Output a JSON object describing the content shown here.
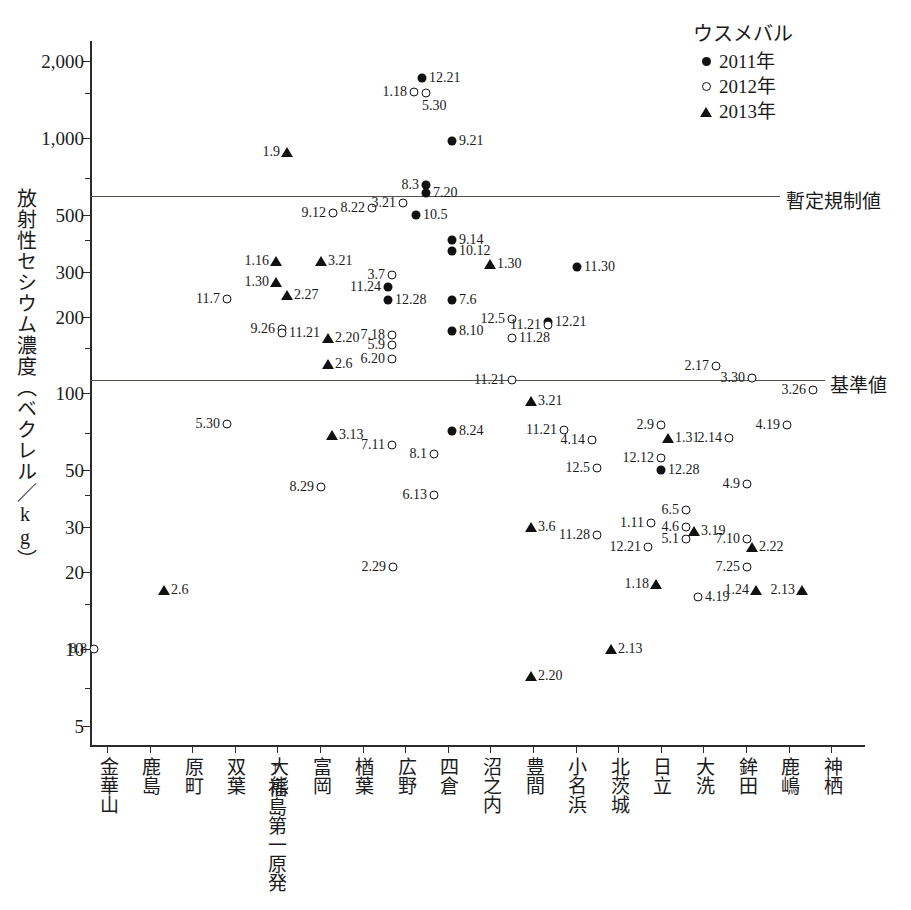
{
  "chart_data": {
    "type": "scatter",
    "title": "",
    "xlabel": "",
    "ylabel": "放射性セシウム濃度（ベクレル／kg）",
    "yscale": "log",
    "ylim": [
      4.2,
      2400
    ],
    "ytick_labels": [
      "2,000",
      "1,000",
      "500",
      "300",
      "200",
      "100",
      "50",
      "30",
      "20",
      "10",
      "5"
    ],
    "ytick_values": [
      2000,
      1000,
      500,
      300,
      200,
      100,
      50,
      30,
      20,
      10,
      5
    ],
    "grid": false,
    "legend_position": "top-right",
    "legend_title": "ウスメバル",
    "series": [
      {
        "name": "2011年",
        "marker": "filled-circle"
      },
      {
        "name": "2012年",
        "marker": "open-circle"
      },
      {
        "name": "2013年",
        "marker": "triangle"
      }
    ],
    "reference_lines": [
      {
        "value": 500,
        "label": "暫定規制値"
      },
      {
        "value": 100,
        "label": "基準値"
      }
    ],
    "categories": [
      "金華山",
      "鹿島",
      "原町",
      "双葉",
      "大熊",
      "富岡",
      "楢葉",
      "広野",
      "四倉",
      "沼之内",
      "豊間",
      "小名浜",
      "北茨城",
      "日立",
      "大洗",
      "鉾田",
      "鹿嶋",
      "神栖"
    ],
    "annotation_arrow": "↑福島第一原発",
    "points": [
      {
        "x": 94,
        "y": 10,
        "series": "2012年",
        "label": "8.8",
        "side": "left"
      },
      {
        "x": 164,
        "y": 17,
        "series": "2013年",
        "label": "2.6",
        "side": "right"
      },
      {
        "x": 227,
        "y": 235,
        "series": "2012年",
        "label": "11.7",
        "side": "left"
      },
      {
        "x": 227,
        "y": 76,
        "series": "2012年",
        "label": "5.30",
        "side": "left"
      },
      {
        "x": 276,
        "y": 330,
        "series": "2013年",
        "label": "1.16",
        "side": "left"
      },
      {
        "x": 276,
        "y": 272,
        "series": "2013年",
        "label": "1.30",
        "side": "left"
      },
      {
        "x": 287,
        "y": 243,
        "series": "2013年",
        "label": "2.27",
        "side": "right"
      },
      {
        "x": 282,
        "y": 179,
        "series": "2012年",
        "label": "9.26",
        "side": "left"
      },
      {
        "x": 282,
        "y": 172,
        "series": "2012年",
        "label": "11.21",
        "side": "right"
      },
      {
        "x": 287,
        "y": 880,
        "series": "2013年",
        "label": "1.9",
        "side": "left"
      },
      {
        "x": 321,
        "y": 330,
        "series": "2013年",
        "label": "3.21",
        "side": "right"
      },
      {
        "x": 321,
        "y": 43,
        "series": "2012年",
        "label": "8.29",
        "side": "left"
      },
      {
        "x": 328,
        "y": 165,
        "series": "2013年",
        "label": "2.20",
        "side": "right"
      },
      {
        "x": 328,
        "y": 130,
        "series": "2013年",
        "label": "2.6",
        "side": "right"
      },
      {
        "x": 332,
        "y": 69,
        "series": "2013年",
        "label": "3.13",
        "side": "right"
      },
      {
        "x": 333,
        "y": 510,
        "series": "2012年",
        "label": "9.12",
        "side": "left"
      },
      {
        "x": 372,
        "y": 530,
        "series": "2012年",
        "label": "8.22",
        "side": "left"
      },
      {
        "x": 388,
        "y": 260,
        "series": "2011年",
        "label": "11.24",
        "side": "left"
      },
      {
        "x": 388,
        "y": 233,
        "series": "2011年",
        "label": "12.28",
        "side": "right"
      },
      {
        "x": 392,
        "y": 290,
        "series": "2012年",
        "label": "3.7",
        "side": "left"
      },
      {
        "x": 392,
        "y": 170,
        "series": "2012年",
        "label": "7.18",
        "side": "left"
      },
      {
        "x": 392,
        "y": 155,
        "series": "2012年",
        "label": "5.9",
        "side": "left"
      },
      {
        "x": 392,
        "y": 137,
        "series": "2012年",
        "label": "6.20",
        "side": "left"
      },
      {
        "x": 392,
        "y": 63,
        "series": "2012年",
        "label": "7.11",
        "side": "left"
      },
      {
        "x": 393,
        "y": 21,
        "series": "2012年",
        "label": "2.29",
        "side": "left"
      },
      {
        "x": 403,
        "y": 555,
        "series": "2012年",
        "label": "3.21",
        "side": "left"
      },
      {
        "x": 416,
        "y": 500,
        "series": "2011年",
        "label": "10.5",
        "side": "right"
      },
      {
        "x": 426,
        "y": 655,
        "series": "2011年",
        "label": "8.3",
        "side": "left"
      },
      {
        "x": 426,
        "y": 610,
        "series": "2011年",
        "label": "7.20",
        "side": "right"
      },
      {
        "x": 434,
        "y": 58,
        "series": "2012年",
        "label": "8.1",
        "side": "left"
      },
      {
        "x": 434,
        "y": 40,
        "series": "2012年",
        "label": "6.13",
        "side": "left"
      },
      {
        "x": 452,
        "y": 400,
        "series": "2011年",
        "label": "9.14",
        "side": "right"
      },
      {
        "x": 452,
        "y": 360,
        "series": "2011年",
        "label": "10.12",
        "side": "right"
      },
      {
        "x": 452,
        "y": 233,
        "series": "2011年",
        "label": "7.6",
        "side": "right"
      },
      {
        "x": 452,
        "y": 176,
        "series": "2011年",
        "label": "8.10",
        "side": "right"
      },
      {
        "x": 452,
        "y": 975,
        "series": "2011年",
        "label": "9.21",
        "side": "right"
      },
      {
        "x": 452,
        "y": 71,
        "series": "2011年",
        "label": "8.24",
        "side": "right"
      },
      {
        "x": 490,
        "y": 320,
        "series": "2013年",
        "label": "1.30",
        "side": "right"
      },
      {
        "x": 512,
        "y": 196,
        "series": "2012年",
        "label": "12.5",
        "side": "left"
      },
      {
        "x": 512,
        "y": 165,
        "series": "2012年",
        "label": "11.28",
        "side": "right"
      },
      {
        "x": 512,
        "y": 113,
        "series": "2012年",
        "label": "11.21",
        "side": "left"
      },
      {
        "x": 531,
        "y": 30,
        "series": "2013年",
        "label": "3.6",
        "side": "right"
      },
      {
        "x": 531,
        "y": 7.8,
        "series": "2013年",
        "label": "2.20",
        "side": "right"
      },
      {
        "x": 531,
        "y": 93,
        "series": "2013年",
        "label": "3.21",
        "side": "right"
      },
      {
        "x": 548,
        "y": 190,
        "series": "2011年",
        "label": "12.21",
        "side": "right"
      },
      {
        "x": 548,
        "y": 185,
        "series": "2012年",
        "label": "11.21",
        "side": "left"
      },
      {
        "x": 564,
        "y": 72,
        "series": "2012年",
        "label": "11.21",
        "side": "left"
      },
      {
        "x": 577,
        "y": 313,
        "series": "2011年",
        "label": "11.30",
        "side": "right"
      },
      {
        "x": 592,
        "y": 66,
        "series": "2012年",
        "label": "4.14",
        "side": "left"
      },
      {
        "x": 597,
        "y": 51,
        "series": "2012年",
        "label": "12.5",
        "side": "left"
      },
      {
        "x": 597,
        "y": 28,
        "series": "2012年",
        "label": "11.28",
        "side": "left"
      },
      {
        "x": 611,
        "y": 10,
        "series": "2013年",
        "label": "2.13",
        "side": "right"
      },
      {
        "x": 651,
        "y": 31,
        "series": "2012年",
        "label": "1.11",
        "side": "left"
      },
      {
        "x": 648,
        "y": 25,
        "series": "2012年",
        "label": "12.21",
        "side": "left"
      },
      {
        "x": 656,
        "y": 18,
        "series": "2013年",
        "label": "1.18",
        "side": "left"
      },
      {
        "x": 661,
        "y": 75,
        "series": "2012年",
        "label": "2.9",
        "side": "left"
      },
      {
        "x": 661,
        "y": 56,
        "series": "2012年",
        "label": "12.12",
        "side": "left"
      },
      {
        "x": 661,
        "y": 50,
        "series": "2011年",
        "label": "12.28",
        "side": "right"
      },
      {
        "x": 668,
        "y": 67,
        "series": "2013年",
        "label": "1.31",
        "side": "right"
      },
      {
        "x": 686,
        "y": 35,
        "series": "2012年",
        "label": "6.5",
        "side": "left"
      },
      {
        "x": 686,
        "y": 30,
        "series": "2012年",
        "label": "4.6",
        "side": "left"
      },
      {
        "x": 686,
        "y": 27,
        "series": "2012年",
        "label": "5.1",
        "side": "left"
      },
      {
        "x": 694,
        "y": 29,
        "series": "2013年",
        "label": "3.19",
        "side": "right"
      },
      {
        "x": 698,
        "y": 16,
        "series": "2012年",
        "label": "4.19",
        "side": "right"
      },
      {
        "x": 716,
        "y": 128,
        "series": "2012年",
        "label": "2.17",
        "side": "left"
      },
      {
        "x": 729,
        "y": 67,
        "series": "2012年",
        "label": "2.14",
        "side": "left"
      },
      {
        "x": 747,
        "y": 44,
        "series": "2012年",
        "label": "4.9",
        "side": "left"
      },
      {
        "x": 747,
        "y": 27,
        "series": "2012年",
        "label": "7.10",
        "side": "left"
      },
      {
        "x": 752,
        "y": 25,
        "series": "2013年",
        "label": "2.22",
        "side": "right"
      },
      {
        "x": 747,
        "y": 21,
        "series": "2012年",
        "label": "7.25",
        "side": "left"
      },
      {
        "x": 756,
        "y": 17,
        "series": "2013年",
        "label": "1.24",
        "side": "left"
      },
      {
        "x": 752,
        "y": 115,
        "series": "2012年",
        "label": "3.30",
        "side": "left"
      },
      {
        "x": 787,
        "y": 75,
        "series": "2012年",
        "label": "4.19",
        "side": "left"
      },
      {
        "x": 802,
        "y": 17,
        "series": "2013年",
        "label": "2.13",
        "side": "left"
      },
      {
        "x": 813,
        "y": 103,
        "series": "2012年",
        "label": "3.26",
        "side": "left"
      },
      {
        "x": 422,
        "y": 1720,
        "series": "2011年",
        "label": "12.21",
        "side": "right"
      },
      {
        "x": 414,
        "y": 1520,
        "series": "2012年",
        "label": "1.18",
        "side": "left"
      },
      {
        "x": 426,
        "y": 1500,
        "series": "2012年",
        "label": "5.30",
        "side": "right-below"
      }
    ]
  },
  "legend": {
    "title": "ウスメバル",
    "entries": [
      {
        "label": "2011年",
        "marker": "filled-circle"
      },
      {
        "label": "2012年",
        "marker": "open-circle"
      },
      {
        "label": "2013年",
        "marker": "triangle"
      }
    ]
  },
  "axes": {
    "y_caption": "放射性セシウム濃度（ベクレル／kg）",
    "y_ticks": [
      "2,000",
      "1,000",
      "500",
      "300",
      "200",
      "100",
      "50",
      "30",
      "20",
      "10",
      "5"
    ]
  },
  "reference_labels": {
    "provisional": "暫定規制値",
    "standard": "基準値"
  },
  "x_categories": [
    "金華山",
    "鹿島",
    "原町",
    "双葉",
    "大熊",
    "富岡",
    "楢葉",
    "広野",
    "四倉",
    "沼之内",
    "豊間",
    "小名浜",
    "北茨城",
    "日立",
    "大洗",
    "鉾田",
    "鹿嶋",
    "神栖"
  ],
  "npp_annotation": "↑福島第一原発",
  "top_cut_text": ""
}
